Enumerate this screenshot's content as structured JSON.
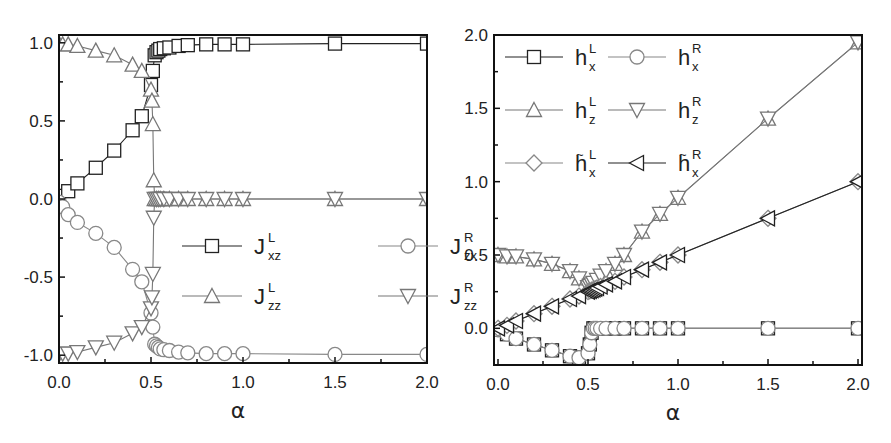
{
  "chart_data": [
    {
      "panel": "left",
      "type": "line",
      "title": "",
      "xlabel": "α",
      "ylabel": "",
      "xlim": [
        0.0,
        2.0
      ],
      "ylim": [
        -1.05,
        1.05
      ],
      "xticks": [
        "0.0",
        "0.5",
        "1.0",
        "1.5",
        "2.0"
      ],
      "yticks": [
        "-1.0",
        "-0.5",
        "0.0",
        "0.5",
        "1.0"
      ],
      "grid": false,
      "legend_position": "center-right",
      "series": [
        {
          "name": "J_xz^L",
          "label_main": "J",
          "label_sup": "L",
          "label_sub": "xz",
          "marker": "square",
          "color": "#222222",
          "x": [
            0.0,
            0.05,
            0.1,
            0.2,
            0.3,
            0.4,
            0.45,
            0.5,
            0.51,
            0.52,
            0.53,
            0.54,
            0.55,
            0.57,
            0.6,
            0.65,
            0.7,
            0.8,
            0.9,
            1.0,
            1.5,
            2.0
          ],
          "y": [
            0.02,
            0.05,
            0.1,
            0.2,
            0.31,
            0.44,
            0.53,
            0.73,
            0.82,
            0.92,
            0.94,
            0.95,
            0.96,
            0.965,
            0.97,
            0.98,
            0.985,
            0.99,
            0.99,
            0.99,
            0.995,
            0.995
          ]
        },
        {
          "name": "J_zx^R",
          "label_main": "J",
          "label_sup": "R",
          "label_sub": "zx",
          "marker": "circle",
          "color": "#888888",
          "x": [
            0.0,
            0.02,
            0.05,
            0.1,
            0.2,
            0.3,
            0.4,
            0.45,
            0.5,
            0.51,
            0.52,
            0.53,
            0.54,
            0.55,
            0.57,
            0.6,
            0.65,
            0.7,
            0.8,
            0.9,
            1.0,
            1.5,
            2.0
          ],
          "y": [
            -0.02,
            -0.05,
            -0.1,
            -0.15,
            -0.22,
            -0.31,
            -0.45,
            -0.53,
            -0.73,
            -0.82,
            -0.93,
            -0.94,
            -0.95,
            -0.96,
            -0.965,
            -0.97,
            -0.98,
            -0.985,
            -0.99,
            -0.99,
            -0.99,
            -0.995,
            -0.995
          ]
        },
        {
          "name": "J_zz^L",
          "label_main": "J",
          "label_sup": "L",
          "label_sub": "zz",
          "marker": "triangle-up",
          "color": "#777777",
          "x": [
            0.0,
            0.02,
            0.05,
            0.1,
            0.2,
            0.3,
            0.4,
            0.45,
            0.5,
            0.505,
            0.51,
            0.515,
            0.52,
            0.53,
            0.54,
            0.55,
            0.57,
            0.6,
            0.65,
            0.7,
            0.8,
            0.9,
            1.0,
            1.5,
            2.0
          ],
          "y": [
            0.995,
            0.99,
            0.99,
            0.98,
            0.95,
            0.92,
            0.86,
            0.82,
            0.7,
            0.63,
            0.48,
            0.12,
            0.0,
            0.0,
            0.0,
            0.0,
            0.0,
            0.0,
            0.0,
            0.0,
            0.0,
            0.0,
            0.0,
            0.0,
            0.0
          ]
        },
        {
          "name": "J_zz^R",
          "label_main": "J",
          "label_sup": "R",
          "label_sub": "zz",
          "marker": "triangle-down",
          "color": "#777777",
          "x": [
            0.0,
            0.02,
            0.05,
            0.1,
            0.2,
            0.3,
            0.4,
            0.45,
            0.5,
            0.505,
            0.51,
            0.515,
            0.52,
            0.53,
            0.54,
            0.55,
            0.57,
            0.6,
            0.65,
            0.7,
            0.8,
            0.9,
            1.0,
            1.5,
            2.0
          ],
          "y": [
            -0.995,
            -0.99,
            -0.99,
            -0.98,
            -0.95,
            -0.92,
            -0.86,
            -0.82,
            -0.7,
            -0.63,
            -0.48,
            -0.12,
            0.0,
            0.0,
            0.0,
            0.0,
            0.0,
            0.0,
            0.0,
            0.0,
            0.0,
            0.0,
            0.0,
            0.0,
            0.0
          ]
        }
      ]
    },
    {
      "panel": "right",
      "type": "line",
      "title": "",
      "xlabel": "α",
      "ylabel": "",
      "xlim": [
        0.0,
        2.0
      ],
      "ylim": [
        -0.25,
        2.0
      ],
      "xticks": [
        "0.0",
        "0.5",
        "1.0",
        "1.5",
        "2.0"
      ],
      "yticks": [
        "0.0",
        "0.5",
        "1.0",
        "1.5",
        "2.0"
      ],
      "grid": false,
      "legend_position": "upper-left",
      "series": [
        {
          "name": "h_x^L",
          "label_main": "h",
          "label_sup": "L",
          "label_sub": "x",
          "tilde": false,
          "marker": "square",
          "color": "#222222",
          "x": [
            0.0,
            0.05,
            0.1,
            0.2,
            0.3,
            0.4,
            0.45,
            0.5,
            0.51,
            0.52,
            0.53,
            0.54,
            0.55,
            0.57,
            0.6,
            0.65,
            0.7,
            0.8,
            0.9,
            1.0,
            1.5,
            2.0
          ],
          "y": [
            -0.01,
            -0.04,
            -0.07,
            -0.11,
            -0.15,
            -0.19,
            -0.2,
            -0.17,
            -0.11,
            -0.03,
            0.0,
            0.0,
            0.0,
            0.0,
            0.0,
            0.0,
            0.0,
            0.0,
            0.0,
            0.0,
            0.0,
            0.0
          ]
        },
        {
          "name": "h_x^R",
          "label_main": "h",
          "label_sup": "R",
          "label_sub": "x",
          "tilde": false,
          "marker": "circle",
          "color": "#888888",
          "x": [
            0.0,
            0.05,
            0.1,
            0.2,
            0.3,
            0.4,
            0.45,
            0.5,
            0.51,
            0.52,
            0.53,
            0.54,
            0.55,
            0.57,
            0.6,
            0.65,
            0.7,
            0.8,
            0.9,
            1.0,
            1.5,
            2.0
          ],
          "y": [
            -0.01,
            -0.04,
            -0.07,
            -0.11,
            -0.15,
            -0.19,
            -0.2,
            -0.17,
            -0.11,
            -0.03,
            0.0,
            0.0,
            0.0,
            0.0,
            0.0,
            0.0,
            0.0,
            0.0,
            0.0,
            0.0,
            0.0,
            0.0
          ]
        },
        {
          "name": "h_z^L",
          "label_main": "h",
          "label_sup": "L",
          "label_sub": "z",
          "tilde": false,
          "marker": "triangle-up",
          "color": "#777777",
          "x": [
            0.0,
            0.05,
            0.1,
            0.2,
            0.3,
            0.4,
            0.45,
            0.5,
            0.51,
            0.52,
            0.53,
            0.55,
            0.57,
            0.6,
            0.65,
            0.7,
            0.8,
            0.9,
            1.0,
            1.5,
            2.0
          ],
          "y": [
            0.5,
            0.49,
            0.49,
            0.47,
            0.44,
            0.39,
            0.34,
            0.28,
            0.29,
            0.3,
            0.31,
            0.33,
            0.36,
            0.39,
            0.44,
            0.5,
            0.66,
            0.78,
            0.89,
            1.43,
            1.95
          ]
        },
        {
          "name": "h_z^R",
          "label_main": "h",
          "label_sup": "R",
          "label_sub": "z",
          "tilde": false,
          "marker": "triangle-down",
          "color": "#777777",
          "x": [
            0.0,
            0.05,
            0.1,
            0.2,
            0.3,
            0.4,
            0.45,
            0.5,
            0.51,
            0.52,
            0.53,
            0.55,
            0.57,
            0.6,
            0.65,
            0.7,
            0.8,
            0.9,
            1.0,
            1.5,
            2.0
          ],
          "y": [
            0.5,
            0.49,
            0.49,
            0.47,
            0.44,
            0.39,
            0.34,
            0.28,
            0.29,
            0.3,
            0.31,
            0.33,
            0.36,
            0.39,
            0.44,
            0.5,
            0.66,
            0.78,
            0.89,
            1.43,
            1.95
          ]
        },
        {
          "name": "h~_x^L",
          "label_main": "h",
          "label_sup": "L",
          "label_sub": "x",
          "tilde": true,
          "marker": "diamond",
          "color": "#888888",
          "x": [
            0.0,
            0.05,
            0.1,
            0.2,
            0.3,
            0.4,
            0.45,
            0.5,
            0.51,
            0.52,
            0.53,
            0.54,
            0.55,
            0.57,
            0.6,
            0.65,
            0.7,
            0.8,
            0.9,
            1.0,
            1.5,
            2.0
          ],
          "y": [
            0.0,
            0.02,
            0.05,
            0.1,
            0.15,
            0.2,
            0.22,
            0.25,
            0.255,
            0.26,
            0.265,
            0.27,
            0.275,
            0.285,
            0.3,
            0.32,
            0.35,
            0.4,
            0.45,
            0.5,
            0.75,
            1.0
          ]
        },
        {
          "name": "h~_x^R",
          "label_main": "h",
          "label_sup": "R",
          "label_sub": "x",
          "tilde": true,
          "marker": "triangle-left",
          "color": "#222222",
          "x": [
            0.0,
            0.05,
            0.1,
            0.2,
            0.3,
            0.4,
            0.45,
            0.5,
            0.51,
            0.52,
            0.53,
            0.54,
            0.55,
            0.57,
            0.6,
            0.65,
            0.7,
            0.8,
            0.9,
            1.0,
            1.5,
            2.0
          ],
          "y": [
            0.0,
            0.02,
            0.05,
            0.1,
            0.15,
            0.2,
            0.22,
            0.25,
            0.255,
            0.26,
            0.265,
            0.27,
            0.275,
            0.285,
            0.3,
            0.32,
            0.35,
            0.4,
            0.45,
            0.5,
            0.75,
            1.0
          ]
        }
      ]
    }
  ],
  "layout": {
    "panels": [
      {
        "frame": {
          "left": 59,
          "top": 35,
          "right": 427,
          "bottom": 363
        },
        "legend": {
          "x": 182,
          "y": 246,
          "col_gap": 196,
          "row_gap": 50,
          "line_len": 60,
          "cols": 2,
          "order": [
            0,
            1,
            2,
            3
          ]
        }
      },
      {
        "frame": {
          "left": 494,
          "top": 35,
          "right": 862,
          "bottom": 365
        },
        "legend": {
          "x": 505,
          "y": 57,
          "col_gap": 103,
          "row_gap": 53,
          "line_len": 58,
          "cols": 2,
          "order": [
            0,
            1,
            2,
            3,
            4,
            5
          ]
        }
      }
    ],
    "xtick_offset_left": 0,
    "xtick_offset_right": 4
  }
}
